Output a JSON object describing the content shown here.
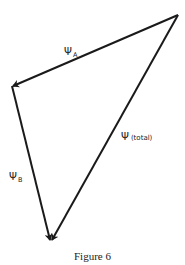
{
  "figure": {
    "caption": "Figure 6",
    "stroke_color": "#1a1a1a",
    "stroke_width": 2
  },
  "vertices": {
    "top_right": {
      "x": 178,
      "y": 15
    },
    "left": {
      "x": 12,
      "y": 86
    },
    "bottom": {
      "x": 51,
      "y": 241
    }
  },
  "vectors": [
    {
      "name": "psi_A",
      "symbol": "Ψ",
      "subscript": "A",
      "from": "top_right",
      "to": "left"
    },
    {
      "name": "psi_B",
      "symbol": "Ψ",
      "subscript": "B",
      "from": "left",
      "to": "bottom"
    },
    {
      "name": "psi_total",
      "symbol": "Ψ",
      "subscript": "(total)",
      "from": "top_right",
      "to": "bottom"
    }
  ],
  "labels": {
    "a": {
      "symbol": "Ψ",
      "subscript": "A"
    },
    "b": {
      "symbol": "Ψ",
      "subscript": "B"
    },
    "total": {
      "symbol": "Ψ",
      "subscript": "(total)"
    }
  }
}
